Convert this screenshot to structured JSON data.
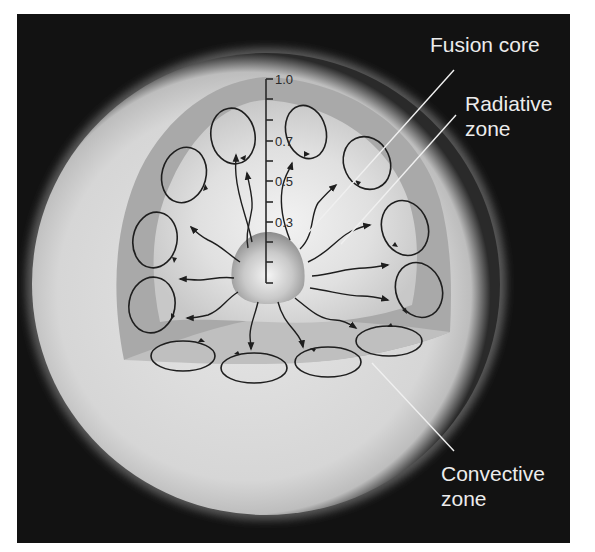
{
  "diagram": {
    "labels": {
      "fusion_core": "Fusion core",
      "radiative_zone_line1": "Radiative",
      "radiative_zone_line2": "zone",
      "convective_zone_line1": "Convective",
      "convective_zone_line2": "zone"
    },
    "scale": {
      "tick_labels": [
        {
          "text": "1.0",
          "value": 1.0
        },
        {
          "text": "0.7",
          "value": 0.7
        },
        {
          "text": "0.5",
          "value": 0.5
        },
        {
          "text": "0.3",
          "value": 0.3
        }
      ],
      "tick_count": 11
    },
    "colors": {
      "background": "#121212",
      "sphere_surface": "#d9d9d9",
      "convective_zone": "#a6a6a6",
      "radiative_zone": "#dcdcdc",
      "core": "#9a9a9a",
      "arrows": "#1e1e1e",
      "label_text": "#ececec",
      "leader_lines": "#f0f0f0"
    },
    "convection_cells": 12,
    "radiation_arrows": 14
  }
}
